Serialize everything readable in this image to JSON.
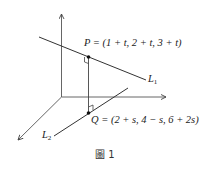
{
  "figure": {
    "caption": "圖 1",
    "point_p": {
      "name": "P",
      "label": "P = (1 + t, 2 + t, 3 + t)"
    },
    "point_q": {
      "name": "Q",
      "label": "Q = (2 + s, 4 − s, 6 + 2s)"
    },
    "line_1": {
      "name": "L",
      "sub": "1"
    },
    "line_2": {
      "name": "L",
      "sub": "2"
    },
    "stroke_color": "#333333"
  }
}
